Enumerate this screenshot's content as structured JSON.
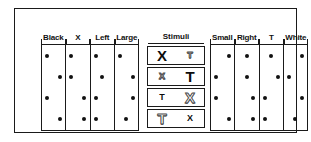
{
  "left_panel": {
    "name": "left-attribute-table",
    "columns": [
      {
        "label": "Black"
      },
      {
        "label": "X"
      },
      {
        "label": "Left"
      },
      {
        "label": "Large"
      }
    ],
    "rows": [
      {
        "positions": [
          "left",
          "left",
          "left",
          "left"
        ]
      },
      {
        "positions": [
          "right",
          "left",
          "center",
          "right"
        ]
      },
      {
        "positions": [
          "left",
          "right",
          "left",
          "right"
        ]
      },
      {
        "positions": [
          "right",
          "right",
          "left",
          "center"
        ]
      }
    ]
  },
  "stimuli_panel": {
    "title": "Stimuli",
    "items": [
      {
        "row": 1,
        "left": {
          "glyph": "X",
          "size": "large",
          "color": "black"
        },
        "right": {
          "glyph": "T",
          "size": "small",
          "color": "white"
        }
      },
      {
        "row": 2,
        "left": {
          "glyph": "X",
          "size": "small",
          "color": "white"
        },
        "right": {
          "glyph": "T",
          "size": "large",
          "color": "black"
        }
      },
      {
        "row": 3,
        "left": {
          "glyph": "T",
          "size": "small",
          "color": "black"
        },
        "right": {
          "glyph": "X",
          "size": "large",
          "color": "white"
        }
      },
      {
        "row": 4,
        "left": {
          "glyph": "T",
          "size": "large",
          "color": "white"
        },
        "right": {
          "glyph": "X",
          "size": "small",
          "color": "black"
        }
      }
    ]
  },
  "right_panel": {
    "name": "right-attribute-table",
    "columns": [
      {
        "label": "Small"
      },
      {
        "label": "Right"
      },
      {
        "label": "T"
      },
      {
        "label": "White"
      }
    ],
    "rows": [
      {
        "positions": [
          "right",
          "center",
          "center",
          "right"
        ]
      },
      {
        "positions": [
          "left",
          "center",
          "right",
          "left"
        ]
      },
      {
        "positions": [
          "left",
          "right",
          "left",
          "right"
        ]
      },
      {
        "positions": [
          "right",
          "right",
          "left",
          "center"
        ]
      }
    ]
  },
  "colors": {
    "ink": "#111111",
    "frame": "#1a1a1a",
    "paper": "#ffffff",
    "outline_glyph": "#6a6a6a"
  }
}
